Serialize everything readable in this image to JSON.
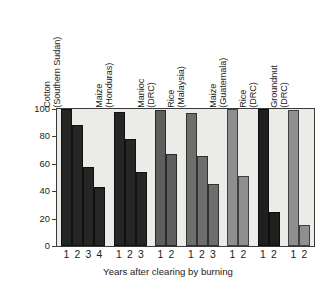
{
  "chart_data": {
    "type": "bar",
    "title": "",
    "xlabel": "Years after clearing by burning",
    "ylabel": "Relative yield",
    "ylim": [
      0,
      100
    ],
    "yticks": [
      0,
      20,
      40,
      60,
      80,
      100
    ],
    "ytick_labels": [
      "0",
      "20",
      "40",
      "60",
      "80",
      "100"
    ],
    "grid": false,
    "legend": "none",
    "x_group_label_note": "each group's bars are labelled by year after clearing",
    "groups": [
      {
        "crop": "Cotton",
        "place": "(Southern Sudan)",
        "color": "#262626",
        "x": [
          "1",
          "2",
          "3",
          "4"
        ],
        "values": [
          100,
          88,
          58,
          43
        ]
      },
      {
        "crop": "Maize",
        "place": "(Honduras)",
        "color": "#262626",
        "x": [
          "1",
          "2",
          "3"
        ],
        "values": [
          98,
          78,
          54
        ]
      },
      {
        "crop": "Manioc",
        "place": "(DRC)",
        "color": "#5e5e5e",
        "x": [
          "1",
          "2"
        ],
        "values": [
          99,
          67
        ]
      },
      {
        "crop": "Rice",
        "place": "(Malaysia)",
        "color": "#6e6e6e",
        "x": [
          "1",
          "2",
          "3"
        ],
        "values": [
          97,
          66,
          45
        ]
      },
      {
        "crop": "Maize",
        "place": "(Guatemala)",
        "color": "#8f8f8f",
        "x": [
          "1",
          "2"
        ],
        "values": [
          100,
          51
        ]
      },
      {
        "crop": "Rice",
        "place": "(DRC)",
        "color": "#1f1f1f",
        "x": [
          "1",
          "2"
        ],
        "values": [
          100,
          25
        ]
      },
      {
        "crop": "Groundnut",
        "place": "(DRC)",
        "color": "#8f8f8f",
        "x": [
          "1",
          "2"
        ],
        "values": [
          99,
          15
        ]
      }
    ]
  },
  "colors": {
    "plot_background": "#ebebe8",
    "page_background": "#ffffff",
    "axis": "#3a3a3a",
    "text": "#1c1c1c"
  }
}
